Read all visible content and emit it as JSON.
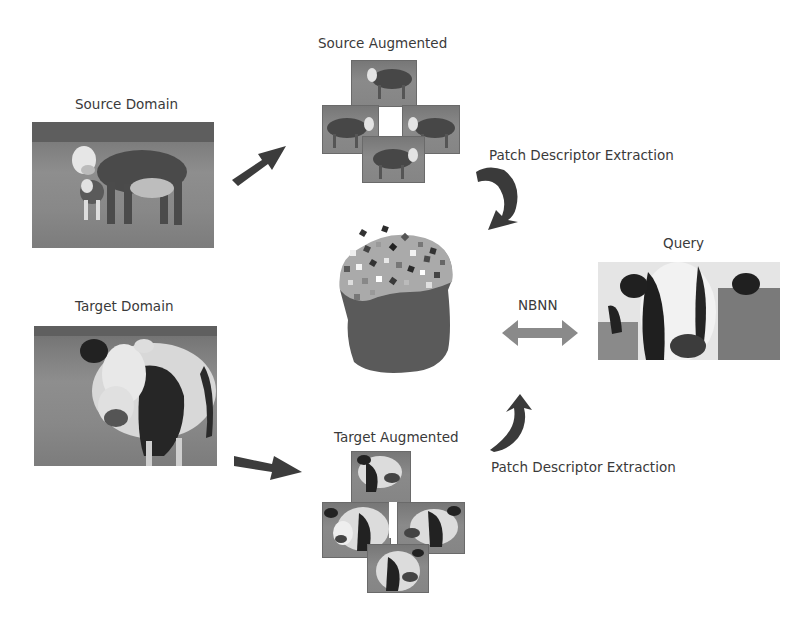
{
  "diagram": {
    "labels": {
      "source_domain": "Source Domain",
      "target_domain": "Target Domain",
      "source_augmented": "Source Augmented",
      "target_augmented": "Target Augmented",
      "patch_extraction_top": "Patch Descriptor Extraction",
      "patch_extraction_bottom": "Patch Descriptor Extraction",
      "nbnn": "NBNN",
      "query": "Query"
    },
    "nodes": [
      {
        "id": "source_domain",
        "kind": "image",
        "content": "hereford cow with calf in pasture"
      },
      {
        "id": "target_domain",
        "kind": "image",
        "content": "holstein cow in pasture"
      },
      {
        "id": "source_augmented",
        "kind": "image-cross",
        "tiles": 4,
        "content": "flipped/shifted hereford cow crops"
      },
      {
        "id": "target_augmented",
        "kind": "image-cross",
        "tiles": 4,
        "content": "flipped/shifted holstein cow crops"
      },
      {
        "id": "descriptor_pool",
        "kind": "container",
        "content": "bucket filled with colored patch squares"
      },
      {
        "id": "query",
        "kind": "image",
        "content": "holstein cow face close-up"
      }
    ],
    "edges": [
      {
        "from": "source_domain",
        "to": "source_augmented",
        "style": "arrow"
      },
      {
        "from": "target_domain",
        "to": "target_augmented",
        "style": "arrow"
      },
      {
        "from": "source_augmented",
        "to": "descriptor_pool",
        "style": "curved-arrow",
        "label": "Patch Descriptor Extraction"
      },
      {
        "from": "target_augmented",
        "to": "descriptor_pool",
        "style": "curved-arrow",
        "label": "Patch Descriptor Extraction"
      },
      {
        "from": "descriptor_pool",
        "to": "query",
        "style": "double-arrow",
        "label": "NBNN"
      }
    ],
    "colors": {
      "arrow": "#3c3c3c",
      "double_arrow": "#8a8a8a",
      "pool_body": "#585858",
      "pool_top": "#a9a9a9",
      "text": "#3a3a3a"
    }
  }
}
